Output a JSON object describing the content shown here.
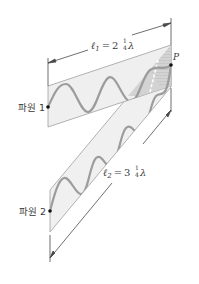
{
  "diagram": {
    "sources": [
      {
        "label": "파원 1",
        "x": 48,
        "y": 107
      },
      {
        "label": "파원 2",
        "x": 50,
        "y": 211
      }
    ],
    "point": {
      "label": "P",
      "x": 171,
      "y": 65
    },
    "path_lengths": [
      {
        "symbol": "ℓ",
        "subscript": "1",
        "equals": "=",
        "whole": "2",
        "num": "1",
        "den": "4",
        "unit": "λ"
      },
      {
        "symbol": "ℓ",
        "subscript": "2",
        "equals": "=",
        "whole": "3",
        "num": "1",
        "den": "4",
        "unit": "λ"
      }
    ],
    "colors": {
      "band_fill": "#efefef",
      "band_stroke": "#9a9a9a",
      "wave": "#9c9c9c",
      "overlap_fill": "#c9c9c9",
      "dim_line": "#4a4a4a",
      "dot": "#111111"
    }
  }
}
